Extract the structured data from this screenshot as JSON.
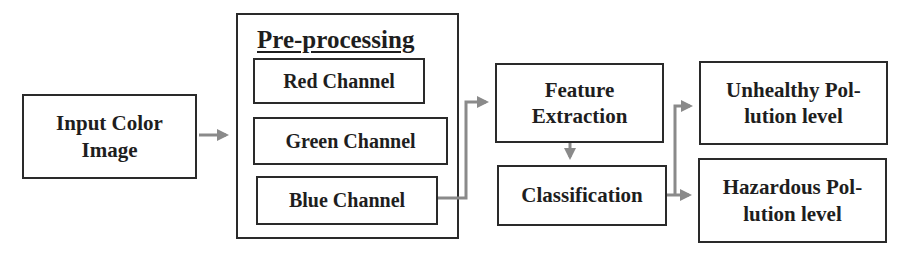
{
  "diagram": {
    "input": {
      "label_line1": "Input Color",
      "label_line2": "Image"
    },
    "preprocessing": {
      "title": "Pre-processing",
      "channels": [
        {
          "label": "Red Channel"
        },
        {
          "label": "Green Channel"
        },
        {
          "label": "Blue Channel"
        }
      ]
    },
    "feature_extraction": {
      "label_line1": "Feature",
      "label_line2": "Extraction"
    },
    "classification": {
      "label": "Classification"
    },
    "outputs": [
      {
        "label_line1": "Unhealthy Pol-",
        "label_line2": "lution level"
      },
      {
        "label_line1": "Hazardous Pol-",
        "label_line2": "lution level"
      }
    ],
    "colors": {
      "box_border": "#2a2a2a",
      "arrow": "#8a8a8a",
      "text": "#1e1e1e"
    }
  }
}
